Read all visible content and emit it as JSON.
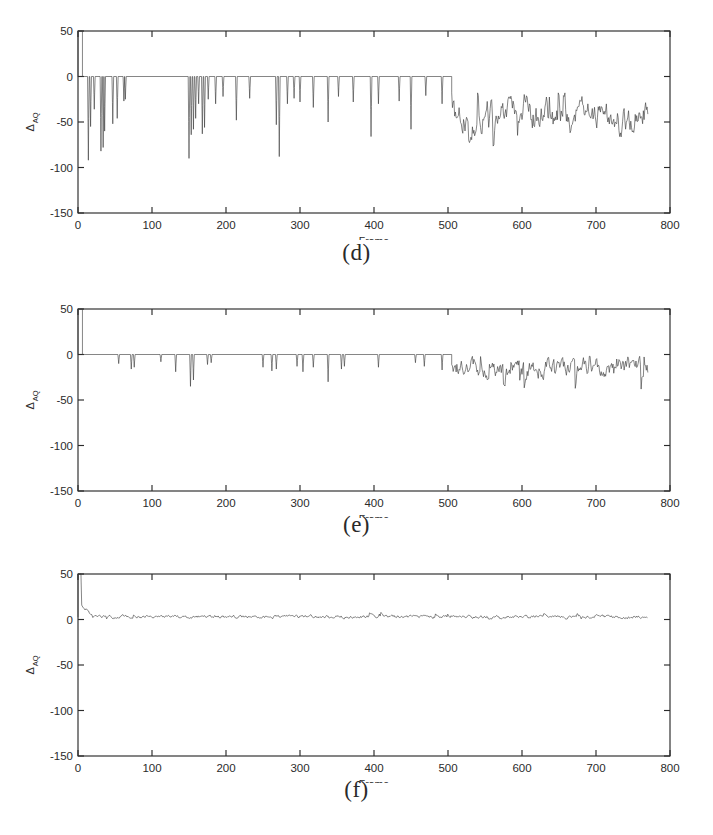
{
  "figure": {
    "background": "#ffffff",
    "line_color": "#3a3a3a",
    "axis_color": "#2b2b2b"
  },
  "panels": [
    {
      "id": "d",
      "caption": "(d)"
    },
    {
      "id": "e",
      "caption": "(e)"
    },
    {
      "id": "f",
      "caption": "(f)"
    }
  ],
  "axes": {
    "xlabel": "Frame",
    "ylabel": "Δ",
    "ylabel_sub": "AQ",
    "xticks": [
      0,
      100,
      200,
      300,
      400,
      500,
      600,
      700,
      800
    ],
    "xtick_labels": [
      "0",
      "100",
      "200",
      "300",
      "400",
      "500",
      "600",
      "700",
      "800"
    ],
    "yticks": [
      50,
      0,
      -50,
      -100,
      -150
    ],
    "ytick_labels": [
      "50",
      "0",
      "-50",
      "-100",
      "-150"
    ],
    "xlim": [
      0,
      800
    ],
    "ylim": [
      -150,
      50
    ]
  },
  "chart_data": [
    {
      "type": "line",
      "panel": "d",
      "title": "(d)",
      "xlabel": "Frame",
      "ylabel": "ΔAQ",
      "xlim": [
        0,
        800
      ],
      "ylim": [
        -150,
        50
      ],
      "grid": false,
      "legend": null,
      "description": "Sparse deep negative spikes on a zero baseline up to frame ~505, then a continuously noisy band roughly between -20 and -75.",
      "baseline": 0,
      "noise_onset_frame": 505,
      "data_end_frame": 770,
      "initial_spike": {
        "frames": [
          0,
          6
        ],
        "value": 50
      },
      "spikes": [
        {
          "frame": 14,
          "depth": -92
        },
        {
          "frame": 17,
          "depth": -55
        },
        {
          "frame": 22,
          "depth": -36
        },
        {
          "frame": 31,
          "depth": -82
        },
        {
          "frame": 34,
          "depth": -78
        },
        {
          "frame": 36,
          "depth": -60
        },
        {
          "frame": 47,
          "depth": -52
        },
        {
          "frame": 53,
          "depth": -46
        },
        {
          "frame": 62,
          "depth": -27
        },
        {
          "frame": 64,
          "depth": -25
        },
        {
          "frame": 150,
          "depth": -90
        },
        {
          "frame": 153,
          "depth": -64
        },
        {
          "frame": 156,
          "depth": -58
        },
        {
          "frame": 159,
          "depth": -46
        },
        {
          "frame": 163,
          "depth": -30
        },
        {
          "frame": 168,
          "depth": -63
        },
        {
          "frame": 171,
          "depth": -56
        },
        {
          "frame": 176,
          "depth": -25
        },
        {
          "frame": 186,
          "depth": -30
        },
        {
          "frame": 196,
          "depth": -22
        },
        {
          "frame": 214,
          "depth": -48
        },
        {
          "frame": 232,
          "depth": -24
        },
        {
          "frame": 268,
          "depth": -53
        },
        {
          "frame": 272,
          "depth": -88
        },
        {
          "frame": 283,
          "depth": -30
        },
        {
          "frame": 292,
          "depth": -24
        },
        {
          "frame": 300,
          "depth": -28
        },
        {
          "frame": 318,
          "depth": -34
        },
        {
          "frame": 338,
          "depth": -50
        },
        {
          "frame": 352,
          "depth": -22
        },
        {
          "frame": 372,
          "depth": -28
        },
        {
          "frame": 396,
          "depth": -66
        },
        {
          "frame": 406,
          "depth": -30
        },
        {
          "frame": 434,
          "depth": -27
        },
        {
          "frame": 450,
          "depth": -58
        },
        {
          "frame": 470,
          "depth": -21
        },
        {
          "frame": 492,
          "depth": -30
        }
      ],
      "noisy_band": {
        "min": -78,
        "max": -18,
        "mean": -44
      }
    },
    {
      "type": "line",
      "panel": "e",
      "title": "(e)",
      "xlabel": "Frame",
      "ylabel": "ΔAQ",
      "xlim": [
        0,
        800
      ],
      "ylim": [
        -150,
        50
      ],
      "grid": false,
      "legend": null,
      "description": "Shallow negative spikes on a zero baseline to frame ~505, then a noisy band mostly between -3 and -35.",
      "baseline": 0,
      "noise_onset_frame": 505,
      "data_end_frame": 770,
      "initial_spike": {
        "frames": [
          0,
          6
        ],
        "value": 50
      },
      "spikes": [
        {
          "frame": 55,
          "depth": -10
        },
        {
          "frame": 72,
          "depth": -16
        },
        {
          "frame": 76,
          "depth": -14
        },
        {
          "frame": 112,
          "depth": -8
        },
        {
          "frame": 132,
          "depth": -19
        },
        {
          "frame": 152,
          "depth": -35
        },
        {
          "frame": 156,
          "depth": -28
        },
        {
          "frame": 175,
          "depth": -11
        },
        {
          "frame": 180,
          "depth": -9
        },
        {
          "frame": 250,
          "depth": -14
        },
        {
          "frame": 262,
          "depth": -18
        },
        {
          "frame": 268,
          "depth": -16
        },
        {
          "frame": 296,
          "depth": -13
        },
        {
          "frame": 304,
          "depth": -19
        },
        {
          "frame": 318,
          "depth": -14
        },
        {
          "frame": 338,
          "depth": -30
        },
        {
          "frame": 356,
          "depth": -16
        },
        {
          "frame": 360,
          "depth": -13
        },
        {
          "frame": 406,
          "depth": -14
        },
        {
          "frame": 456,
          "depth": -9
        },
        {
          "frame": 468,
          "depth": -13
        },
        {
          "frame": 492,
          "depth": -17
        }
      ],
      "noisy_band": {
        "min": -38,
        "max": -2,
        "mean": -15
      }
    },
    {
      "type": "line",
      "panel": "f",
      "title": "(f)",
      "xlabel": "Frame",
      "ylabel": "ΔAQ",
      "xlim": [
        0,
        800
      ],
      "ylim": [
        -150,
        50
      ],
      "grid": false,
      "legend": null,
      "description": "Starts at +50, decays within ~20 frames to a flat low-amplitude band oscillating slightly above zero for the whole sequence.",
      "baseline": 3,
      "noise_onset_frame": 20,
      "data_end_frame": 770,
      "initial_spike": {
        "frames": [
          0,
          4
        ],
        "value": 50
      },
      "spikes": [],
      "noisy_band": {
        "min": -5,
        "max": 11,
        "mean": 3
      }
    }
  ]
}
